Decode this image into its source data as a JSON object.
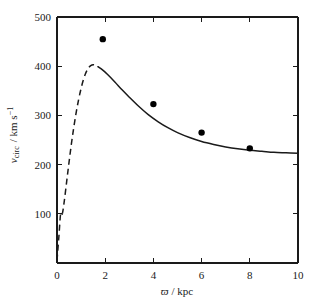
{
  "chart_data": {
    "type": "line",
    "title": "",
    "xlabel": "ϖ / kpc",
    "ylabel": "v_circ / km s^-1",
    "xlabel_symbol": "ϖ",
    "xlabel_unit": "/ kpc",
    "ylabel_symbol": "v",
    "ylabel_subscript": "circ",
    "ylabel_unit": "/ km s",
    "ylabel_unit_exponent": "−1",
    "xlim": [
      0,
      10
    ],
    "ylim": [
      0,
      500
    ],
    "xticks": [
      0,
      2,
      4,
      6,
      8,
      10
    ],
    "xtick_labels": [
      "0",
      "2",
      "4",
      "6",
      "8",
      "10"
    ],
    "yticks": [
      0,
      100,
      200,
      300,
      400,
      500
    ],
    "ytick_labels": [
      "",
      "100",
      "200",
      "300",
      "400",
      "500"
    ],
    "grid": false,
    "legend": null,
    "tick_direction": "in",
    "axis_color": "#1a1a1a",
    "series": [
      {
        "name": "model rotation curve (dashed inner region)",
        "style": "dashed",
        "color": "#1a1a1a",
        "x": [
          0.0,
          0.08,
          0.15,
          0.22,
          0.3,
          0.4,
          0.5,
          0.6,
          0.7,
          0.8,
          0.9,
          1.0,
          1.1,
          1.2,
          1.3,
          1.4,
          1.5,
          1.6,
          1.7
        ],
        "y": [
          5,
          55,
          100,
          100,
          125,
          165,
          205,
          243,
          277,
          307,
          333,
          355,
          373,
          387,
          396,
          401,
          403,
          402,
          399
        ]
      },
      {
        "name": "model rotation curve (solid outer region)",
        "style": "solid",
        "color": "#1a1a1a",
        "x": [
          1.7,
          1.9,
          2.1,
          2.4,
          2.7,
          3.0,
          3.4,
          3.8,
          4.2,
          4.6,
          5.0,
          5.5,
          6.0,
          6.5,
          7.0,
          7.5,
          8.0,
          8.5,
          9.0,
          9.5,
          10.0
        ],
        "y": [
          399,
          392,
          383,
          368,
          352,
          337,
          318,
          301,
          287,
          275,
          265,
          255,
          247,
          241,
          236,
          232,
          229,
          227,
          225,
          224,
          223
        ]
      },
      {
        "name": "observed data points",
        "style": "scatter",
        "color": "#000000",
        "marker": "filled-circle",
        "x": [
          1.9,
          4.0,
          6.0,
          8.0
        ],
        "y": [
          455,
          323,
          265,
          233
        ]
      }
    ]
  }
}
